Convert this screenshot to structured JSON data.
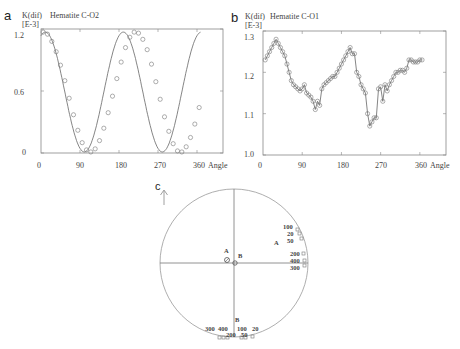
{
  "figure": {
    "panels": {
      "a": {
        "letter": "a",
        "ylabel": "K(dif)",
        "yunit": "[E-3]",
        "title": "Hematite C-O2",
        "xlabel": "Angle",
        "xticks": [
          "0",
          "90",
          "180",
          "270",
          "360"
        ],
        "yticks": [
          "1.2",
          "0.6",
          "0"
        ]
      },
      "b": {
        "letter": "b",
        "ylabel": "K(dif)",
        "yunit": "[E-3]",
        "title": "Hematite C-O1",
        "xlabel": "Angle",
        "xticks": [
          "0",
          "90",
          "180",
          "270",
          "360"
        ],
        "yticks": [
          "1.3",
          "1.2",
          "1.1",
          "1.0"
        ]
      },
      "c": {
        "letter": "c",
        "north_arrow": "↑",
        "labels": {
          "A_center": "A",
          "B_center": "B",
          "A_right": "A",
          "B_bottom": "B",
          "right_100": "100",
          "right_20": "20",
          "right_50": "50",
          "right_200": "200",
          "right_400": "400",
          "right_300": "300",
          "bottom_300": "300",
          "bottom_400": "400",
          "bottom_200": "200",
          "bottom_100": "100",
          "bottom_20": "20",
          "bottom_50": "50"
        }
      }
    }
  },
  "chart_data": [
    {
      "type": "scatter",
      "title": "Hematite C-O2",
      "xlabel": "Angle",
      "ylabel": "K(dif) [E-3]",
      "xlim": [
        0,
        420
      ],
      "ylim": [
        0,
        1.2
      ],
      "grid": false,
      "series": [
        {
          "name": "measured",
          "marker": "circle",
          "line": "fit curve",
          "x": [
            5,
            15,
            25,
            35,
            45,
            55,
            65,
            75,
            85,
            95,
            105,
            115,
            125,
            135,
            145,
            155,
            165,
            175,
            185,
            195,
            205,
            215,
            225,
            235,
            245,
            255,
            265,
            275,
            285,
            295,
            305,
            315,
            325,
            335,
            345,
            355,
            365
          ],
          "y": [
            1.17,
            1.15,
            1.08,
            0.98,
            0.85,
            0.7,
            0.53,
            0.37,
            0.22,
            0.1,
            0.03,
            0.01,
            0.04,
            0.12,
            0.24,
            0.39,
            0.55,
            0.72,
            0.88,
            1.02,
            1.12,
            1.17,
            1.16,
            1.1,
            1.0,
            0.86,
            0.69,
            0.52,
            0.35,
            0.21,
            0.09,
            0.02,
            0.01,
            0.06,
            0.15,
            0.28,
            0.44
          ]
        }
      ]
    },
    {
      "type": "line",
      "title": "Hematite C-O1",
      "xlabel": "Angle",
      "ylabel": "K(dif) [E-3]",
      "xlim": [
        0,
        420
      ],
      "ylim": [
        1.0,
        1.3
      ],
      "grid": false,
      "series": [
        {
          "name": "measured",
          "marker": "circle",
          "x": [
            5,
            10,
            15,
            20,
            25,
            30,
            35,
            40,
            45,
            50,
            55,
            60,
            65,
            70,
            75,
            80,
            85,
            90,
            95,
            100,
            105,
            110,
            115,
            120,
            125,
            130,
            135,
            140,
            145,
            150,
            155,
            160,
            165,
            170,
            175,
            180,
            185,
            190,
            195,
            200,
            205,
            210,
            215,
            220,
            225,
            230,
            235,
            240,
            245,
            250,
            255,
            260,
            265,
            270,
            275,
            280,
            285,
            290,
            295,
            300,
            305,
            310,
            315,
            320,
            325,
            330,
            335,
            340,
            345,
            350,
            355,
            360,
            365
          ],
          "y": [
            1.23,
            1.24,
            1.25,
            1.26,
            1.27,
            1.28,
            1.27,
            1.26,
            1.25,
            1.24,
            1.22,
            1.2,
            1.18,
            1.17,
            1.165,
            1.16,
            1.155,
            1.16,
            1.17,
            1.15,
            1.145,
            1.14,
            1.13,
            1.11,
            1.13,
            1.12,
            1.16,
            1.17,
            1.175,
            1.18,
            1.185,
            1.19,
            1.19,
            1.2,
            1.21,
            1.22,
            1.23,
            1.24,
            1.25,
            1.26,
            1.245,
            1.245,
            1.2,
            1.19,
            1.17,
            1.16,
            1.15,
            1.1,
            1.07,
            1.08,
            1.09,
            1.09,
            1.16,
            1.165,
            1.13,
            1.17,
            1.155,
            1.17,
            1.18,
            1.19,
            1.2,
            1.2,
            1.205,
            1.205,
            1.2,
            1.21,
            1.23,
            1.23,
            1.225,
            1.225,
            1.225,
            1.23,
            1.23
          ]
        }
      ]
    }
  ]
}
